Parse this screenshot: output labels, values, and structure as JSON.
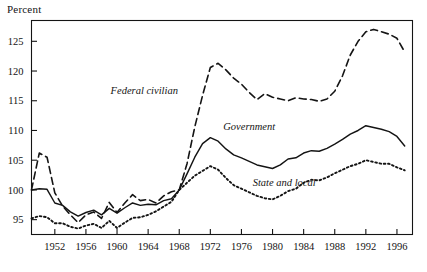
{
  "figure": {
    "ylabel": "Percent",
    "background": "#ffffff",
    "ink": "#141414"
  },
  "chart_data": {
    "type": "line",
    "title": "",
    "xlabel": "",
    "ylabel": "Percent",
    "xlim": [
      1949,
      1998
    ],
    "ylim": [
      92.5,
      128.5
    ],
    "grid": false,
    "legend": "inline-annotations",
    "ytick_labels": [
      "95",
      "100",
      "105",
      "110",
      "115",
      "120",
      "125"
    ],
    "yticks": [
      95,
      100,
      105,
      110,
      115,
      120,
      125
    ],
    "xtick_labels": [
      "1952",
      "1956",
      "1960",
      "1964",
      "1968",
      "1972",
      "1976",
      "1980",
      "1984",
      "1988",
      "1992",
      "1996"
    ],
    "xticks": [
      1952,
      1956,
      1960,
      1964,
      1968,
      1972,
      1976,
      1980,
      1984,
      1988,
      1992,
      1996
    ],
    "x": [
      1949,
      1950,
      1951,
      1952,
      1953,
      1954,
      1955,
      1956,
      1957,
      1958,
      1959,
      1960,
      1961,
      1962,
      1963,
      1964,
      1965,
      1966,
      1967,
      1968,
      1969,
      1970,
      1971,
      1972,
      1973,
      1974,
      1975,
      1976,
      1977,
      1978,
      1979,
      1980,
      1981,
      1982,
      1983,
      1984,
      1985,
      1986,
      1987,
      1988,
      1989,
      1990,
      1991,
      1992,
      1993,
      1994,
      1995,
      1996,
      1997
    ],
    "series": [
      {
        "name": "Federal civilian",
        "style": "dashed",
        "label_x": 1963.5,
        "label_y": 116.2,
        "values": [
          100.0,
          106.2,
          105.5,
          99.5,
          97.3,
          95.8,
          94.5,
          95.8,
          96.3,
          95.2,
          97.9,
          96.2,
          97.8,
          99.2,
          98.2,
          98.4,
          97.8,
          99.0,
          99.7,
          100.0,
          104.4,
          110.6,
          115.9,
          120.6,
          121.3,
          120.2,
          118.8,
          117.8,
          116.4,
          115.2,
          116.2,
          115.6,
          115.3,
          115.0,
          115.5,
          115.3,
          115.2,
          114.9,
          115.3,
          116.6,
          119.2,
          122.7,
          125.0,
          126.6,
          127.0,
          126.6,
          126.2,
          125.5,
          123.2
        ]
      },
      {
        "name": "Government",
        "style": "solid",
        "label_x": 1977.0,
        "label_y": 110.0,
        "values": [
          100.0,
          100.2,
          100.1,
          97.8,
          97.4,
          96.3,
          95.6,
          96.2,
          96.6,
          95.8,
          96.9,
          96.1,
          97.0,
          97.8,
          97.4,
          97.6,
          97.5,
          98.2,
          98.5,
          100.0,
          102.7,
          105.5,
          107.8,
          108.8,
          108.2,
          106.9,
          105.9,
          105.4,
          104.8,
          104.2,
          103.9,
          103.6,
          104.2,
          105.2,
          105.4,
          106.2,
          106.6,
          106.5,
          107.0,
          107.7,
          108.5,
          109.4,
          110.0,
          110.8,
          110.5,
          110.2,
          109.8,
          109.0,
          107.4
        ]
      },
      {
        "name": "State and local",
        "style": "dotted",
        "label_x": 1981.5,
        "label_y": 100.6,
        "values": [
          95.2,
          95.6,
          95.4,
          94.4,
          94.4,
          93.8,
          93.5,
          94.0,
          94.3,
          93.6,
          94.8,
          93.6,
          94.5,
          95.3,
          95.4,
          95.8,
          96.4,
          97.2,
          98.0,
          100.0,
          101.2,
          102.4,
          103.2,
          104.0,
          103.4,
          102.0,
          100.8,
          100.2,
          99.6,
          99.0,
          98.6,
          98.4,
          99.0,
          99.8,
          100.2,
          101.2,
          101.7,
          101.6,
          102.1,
          102.8,
          103.4,
          104.0,
          104.4,
          105.0,
          104.7,
          104.4,
          104.4,
          103.8,
          103.3
        ]
      }
    ]
  }
}
